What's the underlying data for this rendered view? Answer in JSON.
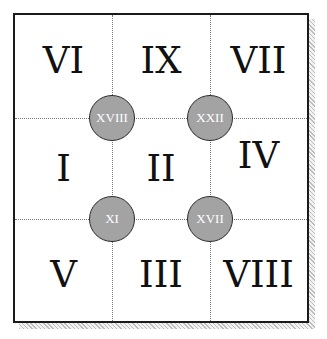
{
  "puzzle": {
    "cells": [
      {
        "row": 0,
        "col": 0,
        "label": "VI"
      },
      {
        "row": 0,
        "col": 1,
        "label": "IX"
      },
      {
        "row": 0,
        "col": 2,
        "label": "VII"
      },
      {
        "row": 1,
        "col": 0,
        "label": "I"
      },
      {
        "row": 1,
        "col": 1,
        "label": "II"
      },
      {
        "row": 1,
        "col": 2,
        "label": "IV"
      },
      {
        "row": 2,
        "col": 0,
        "label": "V"
      },
      {
        "row": 2,
        "col": 1,
        "label": "III"
      },
      {
        "row": 2,
        "col": 2,
        "label": "VIII"
      }
    ],
    "nodes": [
      {
        "position": "top-left",
        "label": "XVIII"
      },
      {
        "position": "top-right",
        "label": "XXII"
      },
      {
        "position": "bottom-left",
        "label": "XI"
      },
      {
        "position": "bottom-right",
        "label": "XVII"
      }
    ],
    "colors": {
      "border": "#1a1a1a",
      "node_fill": "#a3a3a3",
      "node_text": "#ffffff",
      "grid_line": "#777777"
    }
  }
}
